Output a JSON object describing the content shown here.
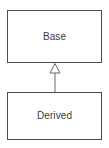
{
  "diagram": {
    "type": "uml-class-diagram",
    "width": 109,
    "height": 148,
    "background_color": "#ffffff",
    "line_color": "#4d4d4d",
    "text_color": "#3a3a3a",
    "classes": [
      {
        "id": "base",
        "name": "Base",
        "x": 7,
        "y": 10,
        "width": 95,
        "height": 53,
        "fill": "#ffffff",
        "stroke": "#4d4d4d"
      },
      {
        "id": "derived",
        "name": "Derived",
        "x": 7,
        "y": 92,
        "width": 95,
        "height": 48,
        "fill": "#ffffff",
        "stroke": "#4d4d4d"
      }
    ],
    "relationships": [
      {
        "id": "derived-inherits-base",
        "kind": "generalization",
        "label": "",
        "from": "derived",
        "to": "base",
        "arrowhead": "hollow-triangle",
        "arrowhead_fill": "#ffffff",
        "arrowhead_stroke": "#6b6b6b",
        "line_x": 55,
        "line_from_y": 73,
        "line_to_y": 92,
        "triangle_apex_y": 63,
        "triangle_base_y": 73,
        "triangle_half_width": 5
      }
    ]
  }
}
